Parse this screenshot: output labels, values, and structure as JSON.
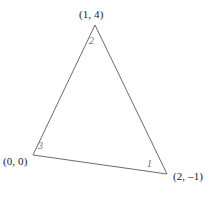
{
  "figure": {
    "background_color": "#ffffff",
    "stroke_color": "#6b6b6b",
    "stroke_width": 1,
    "label_color": "#1a1a1a",
    "side_label_color": "#6e6e6e"
  },
  "vertices": [
    {
      "name": "top",
      "label": "(1, 4)",
      "x": 95,
      "y": 25
    },
    {
      "name": "bottom-left",
      "label": "(0, 0)",
      "x": 33,
      "y": 155
    },
    {
      "name": "bottom-right",
      "label": "(2, –1)",
      "x": 167,
      "y": 174
    }
  ],
  "side_labels": [
    {
      "name": "side-1",
      "label": "1"
    },
    {
      "name": "side-2",
      "label": "2"
    },
    {
      "name": "side-3",
      "label": "3"
    }
  ],
  "chart_data": {
    "type": "scatter",
    "title": "",
    "xlabel": "",
    "ylabel": "",
    "points": [
      {
        "label": "(1, 4)",
        "x": 1,
        "y": 4
      },
      {
        "label": "(0, 0)",
        "x": 0,
        "y": 0
      },
      {
        "label": "(2, -1)",
        "x": 2,
        "y": -1
      }
    ],
    "annotations": [
      "1",
      "2",
      "3"
    ],
    "grid": false,
    "legend": "none"
  }
}
